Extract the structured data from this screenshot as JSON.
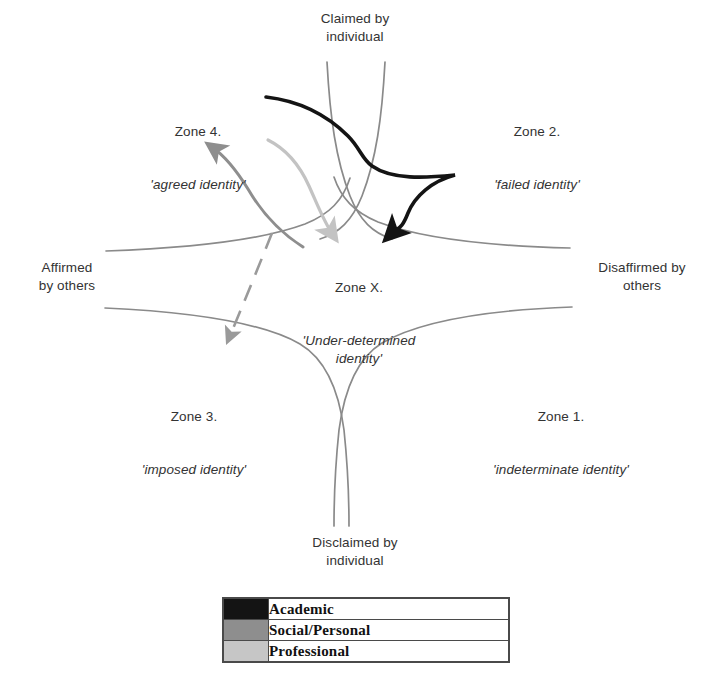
{
  "diagram": {
    "title_axes": {
      "top": "Claimed by\nindividual",
      "bottom": "Disclaimed by\nindividual",
      "left": "Affirmed\nby others",
      "right": "Disaffirmed by\nothers"
    },
    "zones": [
      {
        "id": "zone-4",
        "name": "Zone 4.",
        "descriptor": "'agreed identity'"
      },
      {
        "id": "zone-2",
        "name": "Zone 2.",
        "descriptor": "'failed identity'"
      },
      {
        "id": "zone-3",
        "name": "Zone 3.",
        "descriptor": "'imposed identity'"
      },
      {
        "id": "zone-1",
        "name": "Zone 1.",
        "descriptor": "'indeterminate identity'"
      },
      {
        "id": "zone-x",
        "name": "Zone X.",
        "descriptor": "'Under-determined\nidentity'"
      }
    ]
  },
  "legend": {
    "rows": [
      {
        "label": "Academic",
        "color": "#141414",
        "swatch": "solid-black-swatch"
      },
      {
        "label": "Social/Personal",
        "color": "#8e8e8e",
        "swatch": "mid-grey-swatch"
      },
      {
        "label": "Professional",
        "color": "#c6c6c6",
        "swatch": "light-grey-swatch"
      }
    ]
  },
  "colors": {
    "axis_curve": "#8a8a8a",
    "academic": "#141414",
    "social_personal": "#8e8e8e",
    "professional": "#c3c3c3",
    "dashed_arrow": "#9a9a9a",
    "text": "#333333",
    "border": "#4a4a4a"
  },
  "trajectories": [
    {
      "id": "academic-trajectory",
      "series": "Academic",
      "color": "#141414",
      "style": "solid",
      "start_zone": "Zone 4.",
      "via_zone": "Zone 2.",
      "end_zone": "Zone X.",
      "arrow_at": "end"
    },
    {
      "id": "social-personal-trajectory",
      "series": "Social/Personal",
      "color": "#8e8e8e",
      "style": "solid",
      "start_zone": "Zone X.",
      "end_zone": "Zone 4.",
      "arrow_at": "end"
    },
    {
      "id": "professional-trajectory",
      "series": "Professional",
      "color": "#c3c3c3",
      "style": "solid",
      "start_zone": "Zone 4.",
      "end_zone": "Zone X.",
      "arrow_at": "end"
    },
    {
      "id": "dashed-trajectory",
      "series": "Social/Personal",
      "color": "#9a9a9a",
      "style": "dashed",
      "start_zone": "Zone X.",
      "end_zone": "Zone 3.",
      "arrow_at": "end"
    }
  ]
}
